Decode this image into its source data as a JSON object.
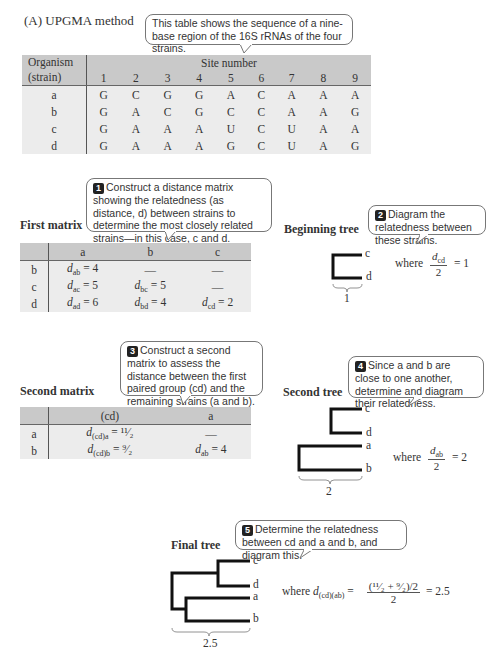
{
  "title": "(A)  UPGMA method",
  "callouts": {
    "intro": "This table shows the sequence of a nine-base region of the 16S rRNAs of the four strains.",
    "step1": {
      "num": "1",
      "text": "Construct a distance matrix showing the relatedness (as distance, d) between strains to determine the most closely related strains—in this case, c and d."
    },
    "step2": {
      "num": "2",
      "text": "Diagram the relatedness between these strains."
    },
    "step3": {
      "num": "3",
      "text": "Construct a second matrix to assess the distance between the first paired group (cd) and the remaining strains (a and b)."
    },
    "step4": {
      "num": "4",
      "text": "Since a and b are close to one another, determine and diagram their relatedness."
    },
    "step5": {
      "num": "5",
      "text": "Determine the relatedness between cd and a and b, and diagram this."
    }
  },
  "sequence_table": {
    "org_header_1": "Organism",
    "org_header_2": "(strain)",
    "site_header": "Site number",
    "sites": [
      "1",
      "2",
      "3",
      "4",
      "5",
      "6",
      "7",
      "8",
      "9"
    ],
    "rows": [
      {
        "strain": "a",
        "bases": [
          "G",
          "C",
          "G",
          "G",
          "A",
          "C",
          "A",
          "A",
          "A"
        ]
      },
      {
        "strain": "b",
        "bases": [
          "G",
          "A",
          "C",
          "G",
          "C",
          "C",
          "A",
          "A",
          "G"
        ]
      },
      {
        "strain": "c",
        "bases": [
          "G",
          "A",
          "A",
          "A",
          "U",
          "C",
          "U",
          "A",
          "A"
        ]
      },
      {
        "strain": "d",
        "bases": [
          "G",
          "A",
          "A",
          "A",
          "G",
          "C",
          "U",
          "A",
          "G"
        ]
      }
    ]
  },
  "first_matrix": {
    "heading": "First matrix",
    "cols": [
      "a",
      "b",
      "c"
    ],
    "rows": [
      {
        "label": "b",
        "cells": [
          {
            "sym": "d",
            "sub": "ab",
            "val": " = 4"
          },
          {
            "dash": "—"
          },
          {
            "dash": "—"
          }
        ]
      },
      {
        "label": "c",
        "cells": [
          {
            "sym": "d",
            "sub": "ac",
            "val": " = 5"
          },
          {
            "sym": "d",
            "sub": "bc",
            "val": " = 5"
          },
          {
            "dash": "—"
          }
        ]
      },
      {
        "label": "d",
        "cells": [
          {
            "sym": "d",
            "sub": "ad",
            "val": " = 6"
          },
          {
            "sym": "d",
            "sub": "bd",
            "val": " = 4"
          },
          {
            "sym": "d",
            "sub": "cd",
            "val": " = 2"
          }
        ]
      }
    ]
  },
  "beginning_tree": {
    "heading": "Beginning tree",
    "leaves": [
      "c",
      "d"
    ],
    "scale": "1",
    "where": "where",
    "frac_sym": "d",
    "frac_sub": "cd",
    "frac_den": "2",
    "result": "= 1"
  },
  "second_matrix": {
    "heading": "Second matrix",
    "cols": [
      "(cd)",
      "a"
    ],
    "rows": [
      {
        "label": "a",
        "c1_sym": "d",
        "c1_sub": "(cd)a",
        "c1_val": " = ¹¹⁄₂",
        "c2": "—"
      },
      {
        "label": "b",
        "c1_sym": "d",
        "c1_sub": "(cd)b",
        "c1_val": " = ⁹⁄₂",
        "c2_sym": "d",
        "c2_sub": "ab",
        "c2_val": " = 4"
      }
    ]
  },
  "second_tree": {
    "heading": "Second tree",
    "leaves": [
      "c",
      "d",
      "a",
      "b"
    ],
    "scale": "2",
    "where": "where",
    "frac_sym": "d",
    "frac_sub": "ab",
    "frac_den": "2",
    "result": "= 2"
  },
  "final_tree": {
    "heading": "Final tree",
    "leaves": [
      "c",
      "d",
      "a",
      "b"
    ],
    "scale": "2.5",
    "where": "where",
    "lhs_sym": "d",
    "lhs_sub": "(cd)(ab)",
    "eq": "=",
    "frac_num": "(¹¹⁄₂ + ⁹⁄₂)/2",
    "frac_den": "2",
    "result": "= 2.5"
  },
  "colors": {
    "table_header_bg": "#c9c9c9",
    "table_body_bg": "#ececec",
    "tree_line": "#111111"
  }
}
